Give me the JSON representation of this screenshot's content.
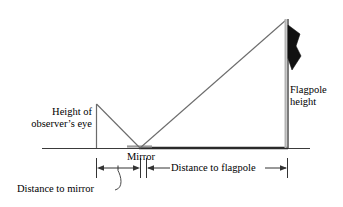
{
  "diagram": {
    "labels": {
      "eye_height_line1": "Height of",
      "eye_height_line2": "observer’s eye",
      "flagpole_height_line1": "Flagpole",
      "flagpole_height_line2": "height",
      "mirror": "Mirror",
      "distance_to_mirror": "Distance to mirror",
      "distance_to_flagpole": "Distance to flagpole"
    },
    "colors": {
      "ink": "#000000",
      "ray": "#6b6b6b",
      "ground": "#3a3a3a",
      "pole_light": "#b4b4b4",
      "pole_dark": "#6e6e6e",
      "flag": "#111111",
      "dimension": "#333333"
    },
    "geometry": {
      "ground_y": 148,
      "ground_x_start": 42,
      "ground_x_end": 310,
      "observer_x": 96,
      "observer_top_y": 104,
      "mirror_x": 140,
      "mirror_segment_start": 127,
      "mirror_segment_end": 152,
      "flagpole_x": 287,
      "flagpole_top_y": 19,
      "dimension_y": 168,
      "dim_mirror_left_x": 96,
      "dim_mirror_right_x": 140,
      "dim_flagpole_left_x": 146,
      "dim_flagpole_right_x": 287,
      "leader_tick_x": 118
    }
  }
}
